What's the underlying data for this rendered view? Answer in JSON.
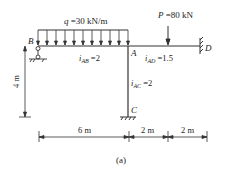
{
  "diagram": {
    "caption": "(a)",
    "load": {
      "distributed_label": "q =30 kN/m",
      "point_label": "P =80 kN"
    },
    "nodes": {
      "B": "B",
      "A": "A",
      "C": "C",
      "D": "D"
    },
    "stiffness": {
      "AB": {
        "sym": "i",
        "sub": "AB",
        "val": "=2"
      },
      "AD": {
        "sym": "i",
        "sub": "AD",
        "val": "=1.5"
      },
      "AC": {
        "sym": "i",
        "sub": "AC",
        "val": "=2"
      }
    },
    "dimensions": {
      "height": "4 m",
      "span_AB": "6 m",
      "span_A_P": "2 m",
      "span_P_D": "2 m"
    },
    "colors": {
      "line": "#333333",
      "text": "#222222"
    }
  }
}
